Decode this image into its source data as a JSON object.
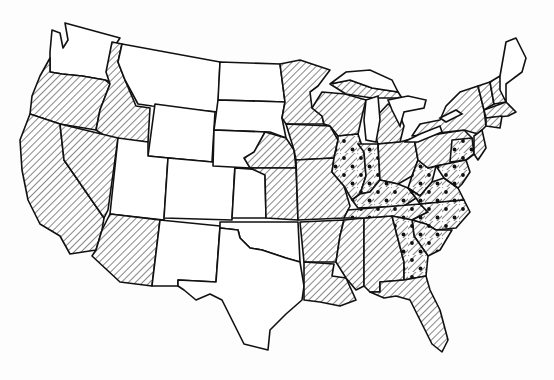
{
  "map": {
    "subject": "United States (contiguous 48 states)",
    "style": "black-and-white line map with pattern fills",
    "colors": {
      "outline": "#111111",
      "background": "#ffffff",
      "pattern": "#111111"
    },
    "categories": [
      {
        "id": "none",
        "pattern": "blank / white"
      },
      {
        "id": "hatch",
        "pattern": "diagonal hatching"
      },
      {
        "id": "dots",
        "pattern": "diagonal hatching with dots"
      }
    ],
    "states": {
      "blank": [
        "Washington",
        "Montana",
        "Wyoming",
        "Utah",
        "Colorado",
        "New Mexico",
        "North Dakota",
        "South Dakota",
        "western Nebraska",
        "western Kansas",
        "Oklahoma",
        "Texas",
        "Maine"
      ],
      "hatched": [
        "Oregon",
        "California",
        "Nevada",
        "Idaho (south)",
        "Arizona",
        "Minnesota",
        "Iowa",
        "eastern Nebraska",
        "eastern Kansas",
        "Missouri",
        "Arkansas",
        "Louisiana",
        "Mississippi",
        "Alabama",
        "Florida",
        "southern Georgia",
        "Wisconsin",
        "Michigan",
        "Ohio",
        "New York",
        "Vermont",
        "New Hampshire",
        "Massachusetts",
        "Connecticut",
        "Rhode Island",
        "New Jersey",
        "Pennsylvania (west)",
        "Delaware"
      ],
      "dotted": [
        "Illinois",
        "Indiana",
        "Kentucky",
        "Tennessee",
        "West Virginia",
        "Virginia",
        "North Carolina",
        "South Carolina",
        "northern Georgia",
        "Pennsylvania (east)",
        "Maryland"
      ]
    }
  }
}
